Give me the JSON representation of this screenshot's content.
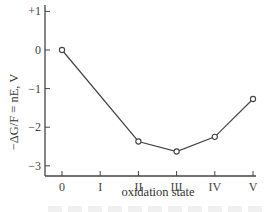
{
  "chart_data": {
    "type": "line",
    "title": "",
    "xlabel": "oxidation state",
    "ylabel": "−ΔG/F = nE, V",
    "categories": [
      "0",
      "I",
      "II",
      "III",
      "IV",
      "V"
    ],
    "series": [
      {
        "name": "Frost diagram",
        "x": [
          "0",
          "II",
          "III",
          "IV",
          "V"
        ],
        "values": [
          0,
          -2.37,
          -2.63,
          -2.25,
          -1.27
        ],
        "marker": "open-circle",
        "color": "#444444"
      }
    ],
    "yticks": [
      "+1",
      "0",
      "−1",
      "−2",
      "−3"
    ],
    "ytick_values": [
      1,
      0,
      -1,
      -2,
      -3
    ],
    "ylim": [
      -3.3,
      1.1
    ],
    "grid": false,
    "legend": null
  },
  "colors": {
    "line": "#444444",
    "axis": "#444444",
    "background": "#ffffff"
  }
}
